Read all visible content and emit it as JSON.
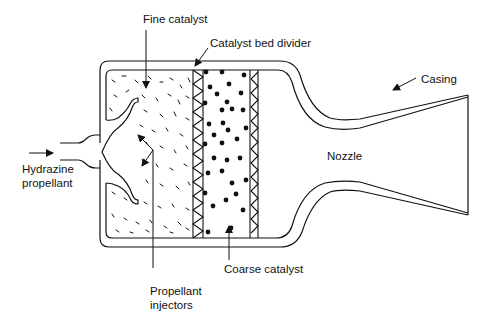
{
  "diagram": {
    "type": "cross-section",
    "labels": {
      "fine_catalyst": "Fine catalyst",
      "catalyst_bed_divider": "Catalyst bed divider",
      "casing": "Casing",
      "hydrazine_line1": "Hydrazine",
      "hydrazine_line2": "propellant",
      "nozzle": "Nozzle",
      "injectors_line1": "Propellant",
      "injectors_line2": "injectors",
      "coarse_catalyst": "Coarse catalyst"
    },
    "components": [
      "Hydrazine propellant inlet",
      "Propellant injectors",
      "Fine catalyst bed",
      "Catalyst bed divider",
      "Coarse catalyst bed",
      "Casing",
      "Nozzle"
    ],
    "colors": {
      "line": "#111111",
      "background": "#ffffff"
    }
  }
}
